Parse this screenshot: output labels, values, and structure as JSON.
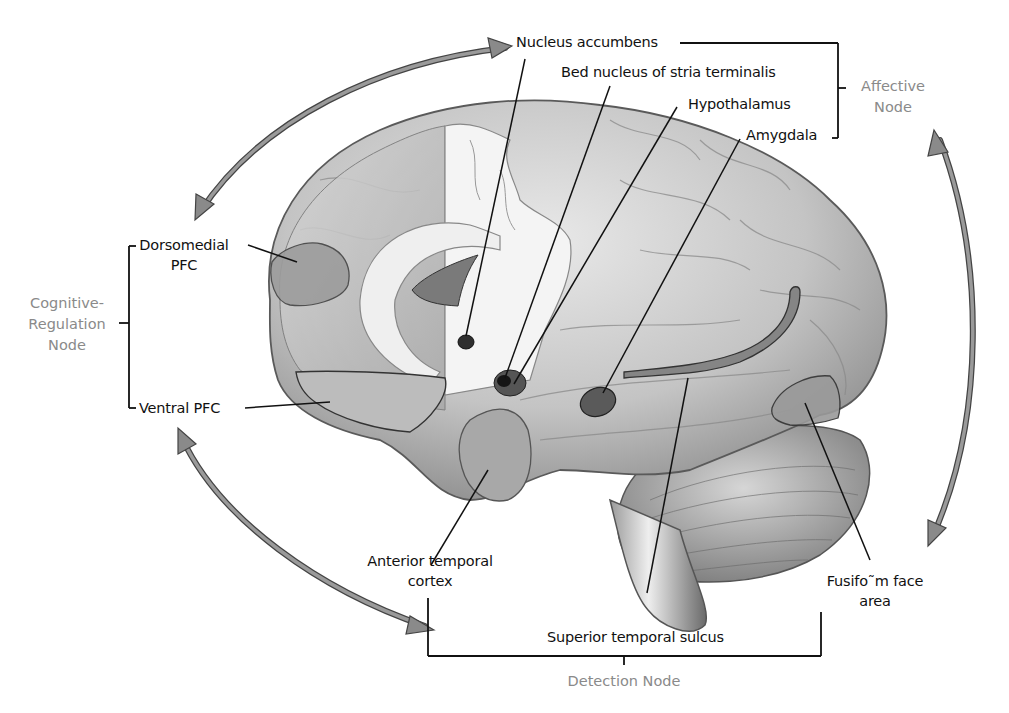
{
  "diagram": {
    "colors": {
      "arrow": "#8a8a8a",
      "arrow_outline": "#444444",
      "brain_base": "#c9c9c9",
      "brain_light": "#e6e6e6",
      "brain_dark": "#7a7a7a",
      "region_fill": "#8f8f8f",
      "leader_line": "#111111",
      "node_label": "#8a8a8a"
    },
    "nodes": {
      "affective": {
        "line1": "Affective",
        "line2": "Node"
      },
      "cognitive_regulation": {
        "line1": "Cognitive-",
        "line2": "Regulation",
        "line3": "Node"
      },
      "detection": {
        "label": "Detection Node"
      }
    },
    "labels": {
      "nucleus_accumbens": "Nucleus accumbens",
      "bed_nucleus": "Bed nucleus of stria terminalis",
      "hypothalamus": "Hypothalamus",
      "amygdala": "Amygdala",
      "dorsomedial_pfc": {
        "line1": "Dorsomedial",
        "line2": "PFC"
      },
      "ventral_pfc": "Ventral PFC",
      "anterior_temporal_cortex": {
        "line1": "Anterior temporal",
        "line2": "cortex"
      },
      "superior_temporal_sulcus": "Superior temporal sulcus",
      "fusiform_face_area": {
        "line1": "Fusifo˜m face",
        "line2": "area"
      }
    }
  }
}
